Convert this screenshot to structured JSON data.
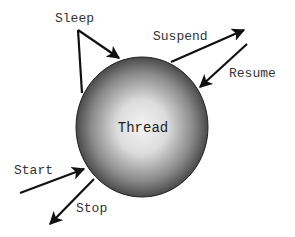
{
  "diagram": {
    "type": "state-transitions",
    "center": {
      "label": "Thread"
    },
    "transitions": [
      {
        "id": "sleep",
        "label": "Sleep",
        "direction": "loop"
      },
      {
        "id": "suspend",
        "label": "Suspend",
        "direction": "out"
      },
      {
        "id": "resume",
        "label": "Resume",
        "direction": "in"
      },
      {
        "id": "start",
        "label": "Start",
        "direction": "in"
      },
      {
        "id": "stop",
        "label": "Stop",
        "direction": "out"
      }
    ]
  },
  "colors": {
    "sphere_light": "#f2f2f2",
    "sphere_dark": "#3a3a3a",
    "arrow": "#111111",
    "text": "#333333"
  }
}
